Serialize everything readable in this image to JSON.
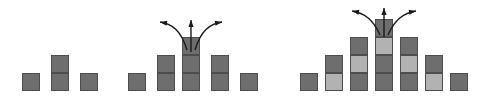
{
  "figure": {
    "canvas": {
      "width": 504,
      "height": 108,
      "background": "#ffffff"
    }
  },
  "style": {
    "block_width": 18,
    "block_height": 18,
    "dark_fill": "#6e6e6e",
    "light_fill": "#b2b2b2",
    "block_border": "#4d4d4d",
    "arrow_color": "#1a1a1a",
    "baseline_y": 91
  },
  "legend": {
    "dark_label": "settled block",
    "light_label": "newly placed block",
    "arrow_label": "toppling direction"
  },
  "panels": [
    {
      "name": "stage-1",
      "label": "Stage 1",
      "origin_x": 22,
      "has_arrows": false,
      "columns": [
        {
          "index": 0,
          "x": 22,
          "height": 1,
          "blocks": [
            "dark"
          ]
        },
        {
          "index": 1,
          "x": 51,
          "height": 2,
          "blocks": [
            "dark",
            "dark"
          ]
        },
        {
          "index": 2,
          "x": 80,
          "height": 1,
          "blocks": [
            "dark"
          ]
        }
      ]
    },
    {
      "name": "stage-2",
      "label": "Stage 2",
      "origin_x": 128,
      "has_arrows": true,
      "arrow_column_index": 2,
      "columns": [
        {
          "index": 0,
          "x": 128,
          "height": 1,
          "blocks": [
            "dark"
          ]
        },
        {
          "index": 1,
          "x": 157,
          "height": 2,
          "blocks": [
            "dark",
            "dark"
          ]
        },
        {
          "index": 2,
          "x": 182,
          "height": 3,
          "blocks": [
            "dark",
            "dark",
            "dark"
          ]
        },
        {
          "index": 3,
          "x": 211,
          "height": 2,
          "blocks": [
            "dark",
            "dark"
          ]
        },
        {
          "index": 4,
          "x": 240,
          "height": 1,
          "blocks": [
            "dark"
          ]
        }
      ]
    },
    {
      "name": "stage-3",
      "label": "Stage 3",
      "origin_x": 300,
      "has_arrows": true,
      "arrow_column_index": 3,
      "columns": [
        {
          "index": 0,
          "x": 300,
          "height": 1,
          "blocks": [
            "dark"
          ]
        },
        {
          "index": 1,
          "x": 325,
          "height": 2,
          "blocks": [
            "dark",
            "light"
          ]
        },
        {
          "index": 2,
          "x": 350,
          "height": 3,
          "blocks": [
            "dark",
            "light",
            "dark"
          ]
        },
        {
          "index": 3,
          "x": 375,
          "height": 4,
          "blocks": [
            "dark",
            "light",
            "dark",
            "dark"
          ]
        },
        {
          "index": 4,
          "x": 400,
          "height": 3,
          "blocks": [
            "dark",
            "light",
            "dark"
          ]
        },
        {
          "index": 5,
          "x": 425,
          "height": 2,
          "blocks": [
            "dark",
            "light"
          ]
        },
        {
          "index": 6,
          "x": 450,
          "height": 1,
          "blocks": [
            "dark"
          ]
        }
      ]
    }
  ],
  "arrows": [
    {
      "panel": "stage-2",
      "name": "arrow-left",
      "direction": "left",
      "path": "M 187 50 C 181 30, 172 24, 160 22",
      "tip": "160,22",
      "angle": -170
    },
    {
      "panel": "stage-2",
      "name": "arrow-up",
      "direction": "up",
      "path": "M 191 52 L 191 20",
      "tip": "191,20",
      "angle": -90
    },
    {
      "panel": "stage-2",
      "name": "arrow-right",
      "direction": "right",
      "path": "M 195 50 C 201 30, 210 24, 222 22",
      "tip": "222,22",
      "angle": -10
    },
    {
      "panel": "stage-3",
      "name": "arrow-left",
      "direction": "left",
      "path": "M 380 35 C 373 19, 364 13, 352 11",
      "tip": "352,11",
      "angle": -170
    },
    {
      "panel": "stage-3",
      "name": "arrow-up",
      "direction": "up",
      "path": "M 384 37 L 384 8",
      "tip": "384,8",
      "angle": -90
    },
    {
      "panel": "stage-3",
      "name": "arrow-right",
      "direction": "right",
      "path": "M 388 35 C 395 19, 404 13, 416 11",
      "tip": "416,11",
      "angle": -10
    }
  ]
}
